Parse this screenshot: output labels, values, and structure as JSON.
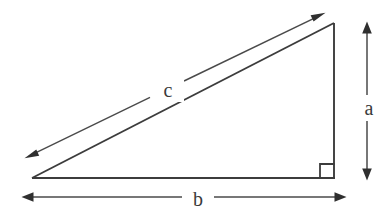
{
  "figure": {
    "kind": "geometry-diagram",
    "background_color": "#ffffff",
    "line_color": "#3c3c3c",
    "label_color": "#3a3a3a",
    "width": 387,
    "height": 216
  },
  "triangle": {
    "name": "right-triangle",
    "vertices": {
      "left": {
        "x": 32,
        "y": 178
      },
      "top_right": {
        "x": 334,
        "y": 23
      },
      "bottom_right": {
        "x": 334,
        "y": 178
      }
    },
    "right_angle_marker": {
      "name": "right-angle-square",
      "x": 320,
      "y": 164,
      "size": 14,
      "at_vertex": "bottom_right"
    }
  },
  "labels": {
    "hypotenuse": "c",
    "vertical_leg": "a",
    "horizontal_leg": "b"
  },
  "dimensions": [
    {
      "key": "hypotenuse",
      "label": "c",
      "orientation": "diagonal",
      "arrow_style": "double-headed",
      "from": {
        "x": 25,
        "y": 158
      },
      "to": {
        "x": 325,
        "y": 13
      },
      "label_position": {
        "x": 166,
        "y": 88
      }
    },
    {
      "key": "vertical_leg",
      "label": "a",
      "orientation": "vertical",
      "arrow_style": "double-headed",
      "from": {
        "x": 367,
        "y": 22
      },
      "to": {
        "x": 367,
        "y": 180
      },
      "label_position": {
        "x": 367,
        "y": 105
      }
    },
    {
      "key": "horizontal_leg",
      "label": "b",
      "orientation": "horizontal",
      "arrow_style": "double-headed",
      "from": {
        "x": 22,
        "y": 197
      },
      "to": {
        "x": 346,
        "y": 197
      },
      "label_position": {
        "x": 195,
        "y": 197
      }
    }
  ]
}
